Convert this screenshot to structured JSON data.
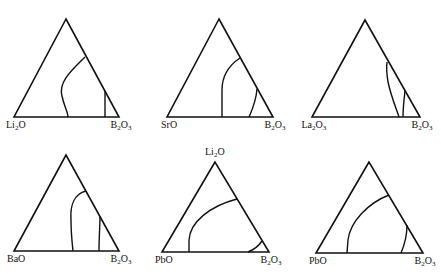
{
  "figure": {
    "diagrams": [
      {
        "id": "d1",
        "apex": {
          "label": "CdO",
          "x": 66,
          "y": 19
        },
        "left": {
          "label": "Li2O",
          "base": "Li",
          "sub": "2",
          "rest": "O",
          "x": 14,
          "y": 117
        },
        "right": {
          "label": "B2O3",
          "base": "B",
          "sub": "2",
          "rest": "O",
          "sub2": "3",
          "x": 119,
          "y": 117
        },
        "boundaries": [
          "M 85 57 C 72 70, 58 82, 62 96 C 64 106, 68 112, 68 117",
          "M 105 91 L 105 117"
        ]
      },
      {
        "id": "d2",
        "apex": {
          "label": "CdO",
          "x": 219,
          "y": 19
        },
        "left": {
          "label": "SrO",
          "base": "SrO",
          "sub": "",
          "rest": "",
          "x": 167,
          "y": 117
        },
        "right": {
          "label": "B2O3",
          "base": "B",
          "sub": "2",
          "rest": "O",
          "sub2": "3",
          "x": 273,
          "y": 117
        },
        "boundaries": [
          "M 240 58 C 228 66, 222 76, 222 90 L 222 117",
          "M 257 89 C 256 102, 252 110, 249 117"
        ]
      },
      {
        "id": "d3",
        "apex": {
          "label": "CdO",
          "x": 365,
          "y": 20
        },
        "left": {
          "label": "La2O3",
          "base": "La",
          "sub": "2",
          "rest": "O",
          "sub2": "3",
          "x": 312,
          "y": 117
        },
        "right": {
          "label": "B2O3",
          "base": "B",
          "sub": "2",
          "rest": "O",
          "sub2": "3",
          "x": 420,
          "y": 117
        },
        "boundaries": [
          "M 387 62 C 386 70, 387 76, 388 82 C 391 96, 396 108, 399 117",
          "M 405 91 C 404 100, 403 108, 403 117"
        ]
      },
      {
        "id": "d4",
        "apex": {
          "label": "CdO",
          "x": 66,
          "y": 155
        },
        "left": {
          "label": "BaO",
          "base": "BaO",
          "sub": "",
          "rest": "",
          "x": 14,
          "y": 251
        },
        "right": {
          "label": "B2O3",
          "base": "B",
          "sub": "2",
          "rest": "O",
          "sub2": "3",
          "x": 119,
          "y": 251
        },
        "boundaries": [
          "M 86 191 C 74 194, 70 206, 71 220 C 71 232, 72 242, 73 251",
          "M 100 216 C 100 226, 99 238, 99 251"
        ]
      },
      {
        "id": "d5",
        "apex": {
          "label": "Li2O",
          "base": "Li",
          "sub": "2",
          "rest": "O",
          "x": 215,
          "y": 162
        },
        "left": {
          "label": "PbO",
          "base": "PbO",
          "sub": "",
          "rest": "",
          "x": 162,
          "y": 252
        },
        "right": {
          "label": "B2O3",
          "base": "B",
          "sub": "2",
          "rest": "O",
          "sub2": "3",
          "x": 269,
          "y": 252
        },
        "boundaries": [
          "M 237 199 C 210 206, 190 222, 189 240 L 189 252",
          "M 262 241 C 258 247, 253 250, 248 252"
        ]
      },
      {
        "id": "d6",
        "apex": {
          "label": "CdO",
          "x": 369,
          "y": 162
        },
        "left": {
          "label": "PbO",
          "base": "PbO",
          "sub": "",
          "rest": "",
          "x": 316,
          "y": 253
        },
        "right": {
          "label": "B2O3",
          "base": "B",
          "sub": "2",
          "rest": "O",
          "sub2": "3",
          "x": 423,
          "y": 253
        },
        "boundaries": [
          "M 389 195 C 368 203, 350 222, 348 240 L 347 253",
          "M 407 225 C 407 236, 404 246, 401 253"
        ]
      }
    ],
    "colors": {
      "line": "#111111",
      "background": "#ffffff"
    }
  }
}
